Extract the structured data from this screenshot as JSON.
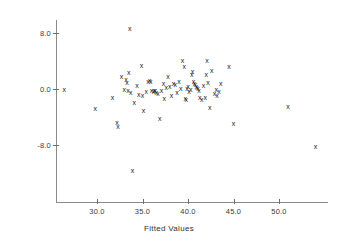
{
  "chart_data": {
    "type": "scatter",
    "title": "",
    "xlabel": "Fitted Values",
    "ylabel": "Residuals",
    "marker": "x",
    "marker_color": "#1a1a1a",
    "grid": false,
    "legend": null,
    "xlim": [
      26.0,
      54.8
    ],
    "ylim": [
      -14.0,
      10.2
    ],
    "xticks": [
      30.0,
      35.0,
      40.0,
      45.0,
      50.0
    ],
    "yticks": [
      8.0,
      0.0,
      -8.0
    ],
    "xticklabels": [
      "30.0",
      "35.0",
      "40.0",
      "45.0",
      "50.0"
    ],
    "yticklabels": [
      "8.0",
      "0.0",
      "-8.0"
    ],
    "n_points": 78,
    "points": [
      {
        "x": 26.4,
        "y": 0.0
      },
      {
        "x": 29.8,
        "y": -2.7
      },
      {
        "x": 31.7,
        "y": -1.1
      },
      {
        "x": 32.2,
        "y": -4.7
      },
      {
        "x": 32.3,
        "y": -5.3
      },
      {
        "x": 32.7,
        "y": 1.9
      },
      {
        "x": 33.0,
        "y": 0.0
      },
      {
        "x": 33.2,
        "y": 1.4
      },
      {
        "x": 33.3,
        "y": 1.0
      },
      {
        "x": 33.4,
        "y": -0.1
      },
      {
        "x": 33.5,
        "y": 2.4
      },
      {
        "x": 33.6,
        "y": 8.7
      },
      {
        "x": 33.7,
        "y": -0.4
      },
      {
        "x": 33.9,
        "y": -11.6
      },
      {
        "x": 34.1,
        "y": -1.9
      },
      {
        "x": 34.4,
        "y": 0.6
      },
      {
        "x": 34.6,
        "y": -0.7
      },
      {
        "x": 34.9,
        "y": 3.4
      },
      {
        "x": 35.0,
        "y": -0.8
      },
      {
        "x": 35.1,
        "y": -3.0
      },
      {
        "x": 35.4,
        "y": -0.3
      },
      {
        "x": 35.6,
        "y": 1.2
      },
      {
        "x": 35.8,
        "y": 1.3
      },
      {
        "x": 35.9,
        "y": 1.1
      },
      {
        "x": 36.0,
        "y": -0.2
      },
      {
        "x": 36.2,
        "y": -0.3
      },
      {
        "x": 36.3,
        "y": -0.1
      },
      {
        "x": 36.4,
        "y": -0.2
      },
      {
        "x": 36.5,
        "y": -0.4
      },
      {
        "x": 36.7,
        "y": -0.6
      },
      {
        "x": 36.9,
        "y": -4.1
      },
      {
        "x": 37.1,
        "y": -0.1
      },
      {
        "x": 37.3,
        "y": 0.8
      },
      {
        "x": 37.4,
        "y": -1.3
      },
      {
        "x": 37.6,
        "y": 0.3
      },
      {
        "x": 37.8,
        "y": 1.8
      },
      {
        "x": 38.0,
        "y": 0.4
      },
      {
        "x": 38.2,
        "y": -0.9
      },
      {
        "x": 38.4,
        "y": 0.9
      },
      {
        "x": 38.6,
        "y": 0.7
      },
      {
        "x": 38.8,
        "y": -0.4
      },
      {
        "x": 39.0,
        "y": 1.1
      },
      {
        "x": 39.2,
        "y": 0.2
      },
      {
        "x": 39.4,
        "y": 4.2
      },
      {
        "x": 39.6,
        "y": 3.3
      },
      {
        "x": 39.7,
        "y": -1.3
      },
      {
        "x": 39.8,
        "y": -1.4
      },
      {
        "x": 39.9,
        "y": 0.1
      },
      {
        "x": 40.0,
        "y": 0.5
      },
      {
        "x": 40.1,
        "y": -0.3
      },
      {
        "x": 40.3,
        "y": 0.0
      },
      {
        "x": 40.4,
        "y": 2.2
      },
      {
        "x": 40.5,
        "y": 2.6
      },
      {
        "x": 40.6,
        "y": 1.2
      },
      {
        "x": 40.7,
        "y": 0.9
      },
      {
        "x": 40.8,
        "y": 0.7
      },
      {
        "x": 40.9,
        "y": 0.4
      },
      {
        "x": 41.0,
        "y": 0.3
      },
      {
        "x": 41.1,
        "y": 0.1
      },
      {
        "x": 41.2,
        "y": -0.2
      },
      {
        "x": 41.3,
        "y": -1.2
      },
      {
        "x": 41.5,
        "y": -1.4
      },
      {
        "x": 41.7,
        "y": 0.6
      },
      {
        "x": 41.9,
        "y": -1.2
      },
      {
        "x": 42.0,
        "y": 2.1
      },
      {
        "x": 42.1,
        "y": 4.1
      },
      {
        "x": 42.2,
        "y": 1.0
      },
      {
        "x": 42.4,
        "y": -2.5
      },
      {
        "x": 42.6,
        "y": 2.7
      },
      {
        "x": 42.9,
        "y": -0.5
      },
      {
        "x": 43.1,
        "y": 0.0
      },
      {
        "x": 43.2,
        "y": -0.9
      },
      {
        "x": 43.4,
        "y": -0.3
      },
      {
        "x": 43.6,
        "y": 0.9
      },
      {
        "x": 44.5,
        "y": 3.3
      },
      {
        "x": 45.0,
        "y": -4.9
      },
      {
        "x": 51.0,
        "y": -2.4
      },
      {
        "x": 54.0,
        "y": -8.2
      }
    ],
    "axis_geometry": {
      "x_pixel_at_30": 97,
      "x_pixels_per_unit": 9.1,
      "y_pixel_at_0": 89,
      "y_pixels_per_unit": 7.0
    }
  }
}
